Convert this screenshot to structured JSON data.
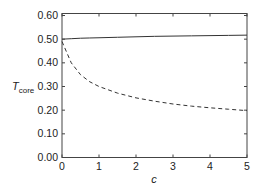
{
  "chart_data": {
    "type": "line",
    "title": "",
    "xlabel": "c",
    "ylabel": "T",
    "ylabel_subscript": "core",
    "xlim": [
      0,
      5
    ],
    "ylim": [
      0.0,
      0.6
    ],
    "grid": false,
    "legend": null,
    "xticks": [
      "0",
      "1",
      "2",
      "3",
      "4",
      "5"
    ],
    "yticks": [
      "0.00",
      "0.10",
      "0.20",
      "0.30",
      "0.40",
      "0.50",
      "0.60"
    ],
    "x": [
      0,
      0.25,
      0.5,
      0.75,
      1,
      1.5,
      2,
      2.5,
      3,
      3.5,
      4,
      4.5,
      5
    ],
    "series": [
      {
        "name": "solid",
        "style": "solid",
        "color": "#333333",
        "values": [
          0.5,
          0.502,
          0.504,
          0.505,
          0.506,
          0.508,
          0.51,
          0.512,
          0.513,
          0.514,
          0.515,
          0.516,
          0.517
        ]
      },
      {
        "name": "dashed",
        "style": "dashed",
        "color": "#333333",
        "values": [
          0.49,
          0.4,
          0.35,
          0.32,
          0.3,
          0.272,
          0.252,
          0.238,
          0.226,
          0.217,
          0.21,
          0.204,
          0.198
        ]
      }
    ]
  }
}
